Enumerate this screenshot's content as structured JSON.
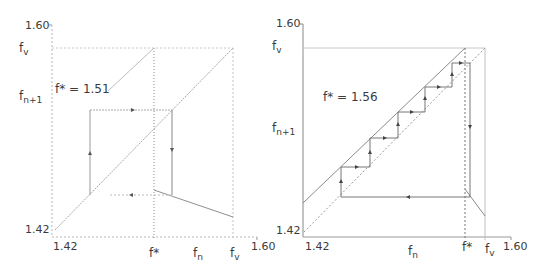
{
  "panels": [
    {
      "id": "left",
      "annotation": "f* = 1.51",
      "y_axis": {
        "label_main": "f",
        "label_sub": "n+1",
        "top_tick": "1.60",
        "bottom_tick": "1.42",
        "fv_label_main": "f",
        "fv_label_sub": "v"
      },
      "x_axis": {
        "label_main": "f",
        "label_sub": "n",
        "left_tick": "1.42",
        "right_tick": "1.60",
        "fstar_label": "f*",
        "fv_label_main": "f",
        "fv_label_sub": "v"
      }
    },
    {
      "id": "right",
      "annotation": "f* = 1.56",
      "y_axis": {
        "label_main": "f",
        "label_sub": "n+1",
        "top_tick": "1.60",
        "bottom_tick": "1.42",
        "fv_label_main": "f",
        "fv_label_sub": "v"
      },
      "x_axis": {
        "label_main": "f",
        "label_sub": "n",
        "left_tick": "1.42",
        "right_tick": "1.60",
        "fstar_label": "f*",
        "fv_label_main": "f",
        "fv_label_sub": "v"
      }
    }
  ],
  "colors": {
    "axis": "#9a9a9a",
    "curve": "#8a8a8a",
    "cobweb": "#555555",
    "dotted": "#b0b0b0"
  }
}
